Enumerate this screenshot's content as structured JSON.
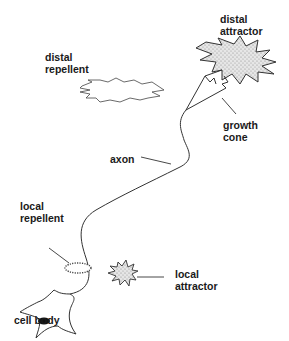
{
  "diagram": {
    "labels": {
      "distal_attractor": [
        "distal",
        "attractor"
      ],
      "distal_repellent": [
        "distal",
        "repellent"
      ],
      "growth_cone": [
        "growth",
        "cone"
      ],
      "axon": "axon",
      "local_repellent": [
        "local",
        "repellent"
      ],
      "local_attractor": [
        "local",
        "attractor"
      ],
      "cell_body": "cell body"
    },
    "colors": {
      "stroke": "#333333",
      "text": "#1a1a1a",
      "stipple": "#9a9a9a",
      "nucleus": "#111111"
    }
  }
}
